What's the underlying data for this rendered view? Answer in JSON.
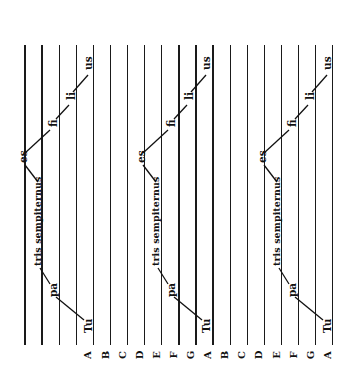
{
  "diagram": {
    "orientation": "rotated -90deg",
    "staff": {
      "line_count": 19,
      "first_x": 25,
      "spacing": 17.1,
      "top": 45,
      "bottom": 345,
      "line_color": "#1a1a1a"
    },
    "pitch_labels": [
      "A",
      "B",
      "C",
      "D",
      "E",
      "F",
      "G",
      "A",
      "B",
      "C",
      "D",
      "E",
      "F",
      "G",
      "A"
    ],
    "pitch_label_start_line": 4,
    "panels": [
      {
        "offset_x": 0,
        "syllables": [
          {
            "text": "Tu",
            "x": 83,
            "y": 333
          },
          {
            "text": "pa",
            "x": 48,
            "y": 297
          },
          {
            "text": "tris sempiternus",
            "x": 33,
            "y": 266
          },
          {
            "text": "es",
            "x": 18,
            "y": 163
          },
          {
            "text": "fi",
            "x": 48,
            "y": 127
          },
          {
            "text": "li",
            "x": 66,
            "y": 100
          },
          {
            "text": "us",
            "x": 83,
            "y": 70
          }
        ]
      },
      {
        "offset_x": 118,
        "syllables": [
          {
            "text": "Tu",
            "x": 83,
            "y": 333
          },
          {
            "text": "pa",
            "x": 48,
            "y": 297
          },
          {
            "text": "tris sempiternus",
            "x": 33,
            "y": 266
          },
          {
            "text": "es",
            "x": 18,
            "y": 163
          },
          {
            "text": "fi",
            "x": 48,
            "y": 127
          },
          {
            "text": "li",
            "x": 66,
            "y": 100
          },
          {
            "text": "us",
            "x": 83,
            "y": 70
          }
        ]
      },
      {
        "offset_x": 239,
        "syllables": [
          {
            "text": "Tu",
            "x": 83,
            "y": 333
          },
          {
            "text": "pa",
            "x": 48,
            "y": 297
          },
          {
            "text": "tris sempiternus",
            "x": 33,
            "y": 266
          },
          {
            "text": "es",
            "x": 18,
            "y": 163
          },
          {
            "text": "fi",
            "x": 48,
            "y": 127
          },
          {
            "text": "li",
            "x": 66,
            "y": 100
          },
          {
            "text": "us",
            "x": 83,
            "y": 70
          }
        ]
      }
    ],
    "connectors": [
      [
        84,
        320,
        56,
        297
      ],
      [
        50,
        284,
        40,
        268
      ],
      [
        38,
        182,
        25,
        165
      ],
      [
        25,
        153,
        50,
        130
      ],
      [
        56,
        119,
        69,
        105
      ],
      [
        73,
        92,
        88,
        75
      ]
    ]
  }
}
